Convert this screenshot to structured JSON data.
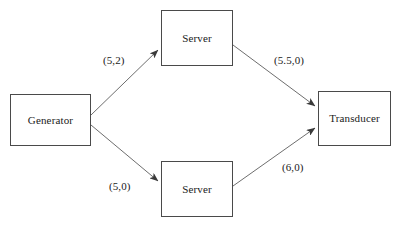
{
  "diagram": {
    "type": "directed-graph",
    "background_color": "#ffffff",
    "node_border_color": "#4a4a4a",
    "edge_color": "#6e6e6e",
    "text_color": "#1a1a1a",
    "nodes": [
      {
        "id": "generator",
        "label": "Generator",
        "x": 10,
        "y": 94,
        "width": 81,
        "height": 52
      },
      {
        "id": "server-top",
        "label": "Server",
        "x": 161,
        "y": 10,
        "width": 72,
        "height": 56
      },
      {
        "id": "server-bottom",
        "label": "Server",
        "x": 161,
        "y": 161,
        "width": 72,
        "height": 56
      },
      {
        "id": "transducer",
        "label": "Transducer",
        "x": 318,
        "y": 91,
        "width": 73,
        "height": 55
      }
    ],
    "edges": [
      {
        "id": "gen-to-server-top",
        "from": "generator",
        "to": "server-top",
        "label": "(5,2)",
        "x1": 91,
        "y1": 115,
        "x2": 160,
        "y2": 48,
        "label_x": 103,
        "label_y": 55
      },
      {
        "id": "server-top-to-transducer",
        "from": "server-top",
        "to": "transducer",
        "label": "(5.5,0)",
        "x1": 233,
        "y1": 45,
        "x2": 317,
        "y2": 108,
        "label_x": 274,
        "label_y": 55
      },
      {
        "id": "gen-to-server-bottom",
        "from": "generator",
        "to": "server-bottom",
        "label": "(5,0)",
        "x1": 91,
        "y1": 125,
        "x2": 160,
        "y2": 183,
        "label_x": 109,
        "label_y": 181
      },
      {
        "id": "server-bottom-to-transducer",
        "from": "server-bottom",
        "to": "transducer",
        "label": "(6,0)",
        "x1": 233,
        "y1": 186,
        "x2": 317,
        "y2": 126,
        "label_x": 282,
        "label_y": 162
      }
    ]
  }
}
